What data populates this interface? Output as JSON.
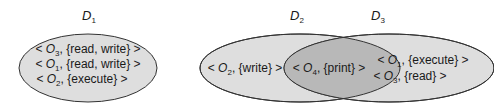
{
  "colors": {
    "ellipse_fill": "#dedede",
    "intersection_fill": "#b8b8b8",
    "stroke": "#333333"
  },
  "domains": [
    {
      "name": "D",
      "sub": "1",
      "entries": [
        {
          "lt": "<",
          "obj": "O",
          "sub": "3",
          "rights": ", {read, write}",
          "gt": ">"
        },
        {
          "lt": "<",
          "obj": "O",
          "sub": "1",
          "rights": ", {read, write}",
          "gt": ">"
        },
        {
          "lt": "<",
          "obj": "O",
          "sub": "2",
          "rights": ", {execute}",
          "gt": ">"
        }
      ]
    },
    {
      "name": "D",
      "sub": "2",
      "entries": [
        {
          "lt": "<",
          "obj": "O",
          "sub": "2",
          "rights": ", {write}",
          "gt": ">"
        }
      ]
    },
    {
      "name": "D",
      "sub": "3",
      "entries": [
        {
          "lt": "<",
          "obj": "O",
          "sub": "1",
          "rights": ", {execute}",
          "gt": ">"
        },
        {
          "lt": "<",
          "obj": "O",
          "sub": "3",
          "rights": ", {read}",
          "gt": ">"
        }
      ]
    }
  ],
  "shared": {
    "entries": [
      {
        "lt": "<",
        "obj": "O",
        "sub": "4",
        "rights": ", {print}",
        "gt": ">"
      }
    ]
  }
}
